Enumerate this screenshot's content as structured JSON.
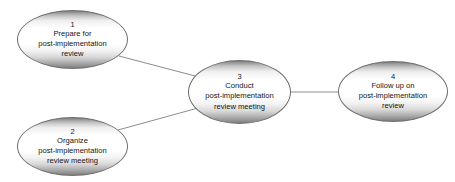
{
  "canvas": {
    "width": 455,
    "height": 182,
    "background": "#ffffff",
    "title": "Post-implementation review activity network"
  },
  "style": {
    "node_border_color": "#6f6f6f",
    "node_fill_top": "#7a7a7a",
    "node_fill_mid": "#ffffff",
    "node_fill_bottom": "#7d7d7d",
    "edge_color": "#8c8c8c",
    "text_color": "#141414"
  },
  "nodes": [
    {
      "key": "node-1",
      "id": "1",
      "label": "Prepare for\npost-implementation\nreview",
      "x": 17,
      "y": 10,
      "width": 111,
      "height": 59
    },
    {
      "key": "node-2",
      "id": "2",
      "label": "Organize\npost-implementation\nreview meeting",
      "x": 17,
      "y": 117,
      "width": 111,
      "height": 59
    },
    {
      "key": "node-3",
      "id": "3",
      "label": "Conduct\npost-implementation\nreview meeting",
      "x": 188,
      "y": 60,
      "width": 103,
      "height": 64
    },
    {
      "key": "node-4",
      "id": "4",
      "label": "Follow up on\npost-implementation\nreview",
      "x": 338,
      "y": 61,
      "width": 110,
      "height": 61
    }
  ],
  "edges": [
    {
      "key": "edge-1-3",
      "from": "1",
      "to": "3",
      "x1": 119,
      "y1": 56,
      "x2": 199,
      "y2": 77
    },
    {
      "key": "edge-2-3",
      "from": "2",
      "to": "3",
      "x1": 118,
      "y1": 130,
      "x2": 198,
      "y2": 108
    },
    {
      "key": "edge-3-4",
      "from": "3",
      "to": "4",
      "x1": 290,
      "y1": 92,
      "x2": 340,
      "y2": 92
    }
  ]
}
